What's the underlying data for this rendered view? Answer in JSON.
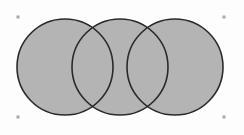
{
  "diagram": {
    "type": "venn-three-circles",
    "fill_color": "#b4b4b4",
    "stroke_color": "#2a2a2a",
    "handle_color": "#a8a8a8",
    "circles": [
      {
        "name": "left",
        "cx": 65,
        "cy": 67,
        "r": 48
      },
      {
        "name": "middle",
        "cx": 120,
        "cy": 67,
        "r": 48
      },
      {
        "name": "right",
        "cx": 175,
        "cy": 67,
        "r": 48
      }
    ],
    "selection_handles": [
      {
        "x": 18,
        "y": 17
      },
      {
        "x": 224,
        "y": 17
      },
      {
        "x": 18,
        "y": 117
      },
      {
        "x": 224,
        "y": 117
      }
    ]
  }
}
